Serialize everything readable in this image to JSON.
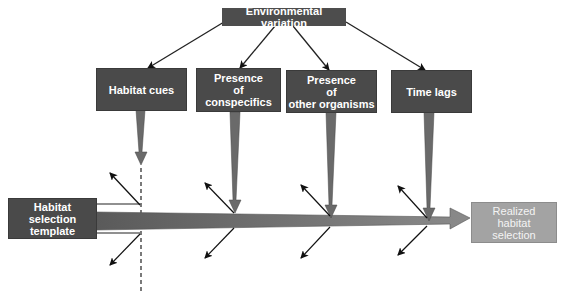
{
  "diagram": {
    "title": "Environmental variation",
    "factors": [
      {
        "id": "habitat-cues",
        "lines": [
          "Habitat cues"
        ]
      },
      {
        "id": "conspecifics",
        "lines": [
          "Presence",
          "of",
          "conspecifics"
        ]
      },
      {
        "id": "other-organisms",
        "lines": [
          "Presence",
          "of",
          "other organisms"
        ]
      },
      {
        "id": "time-lags",
        "lines": [
          "Time lags"
        ]
      }
    ],
    "source": {
      "lines": [
        "Habitat",
        "selection",
        "template"
      ]
    },
    "result": {
      "lines": [
        "Realized",
        "habitat",
        "selection"
      ]
    },
    "colors": {
      "dark_box": "#4a4a4a",
      "light_box": "#a3a3a3",
      "arrow_fill": "#6e6e6e",
      "line": "#1a1a1a"
    }
  }
}
